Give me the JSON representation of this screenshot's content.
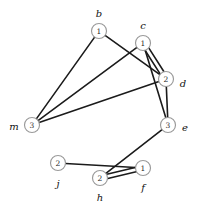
{
  "figure": {
    "type": "graph-diagram",
    "background_color": "#ffffff",
    "edge_color": "#1b1b1b",
    "node_fill": "#ffffff",
    "node_stroke": "#9a9a9a",
    "label_color": "#111111"
  },
  "nodes": [
    {
      "id": "b",
      "label": "b",
      "value": "1",
      "cx": 99,
      "cy": 31,
      "r": 7.5,
      "label_x": 99,
      "label_y": 13
    },
    {
      "id": "c",
      "label": "c",
      "value": "1",
      "cx": 143,
      "cy": 43,
      "r": 7.5,
      "label_x": 143,
      "label_y": 25
    },
    {
      "id": "d",
      "label": "d",
      "value": "2",
      "cx": 166,
      "cy": 79,
      "r": 7.5,
      "label_x": 183,
      "label_y": 83
    },
    {
      "id": "e",
      "label": "e",
      "value": "3",
      "cx": 168,
      "cy": 125,
      "r": 7.5,
      "label_x": 185,
      "label_y": 127
    },
    {
      "id": "m",
      "label": "m",
      "value": "3",
      "cx": 32,
      "cy": 125,
      "r": 7.5,
      "label_x": 14,
      "label_y": 126
    },
    {
      "id": "j",
      "label": "j",
      "value": "2",
      "cx": 58,
      "cy": 163,
      "r": 7.5,
      "label_x": 58,
      "label_y": 183
    },
    {
      "id": "h",
      "label": "h",
      "value": "2",
      "cx": 100,
      "cy": 178,
      "r": 7.5,
      "label_x": 100,
      "label_y": 197
    },
    {
      "id": "f",
      "label": "f",
      "value": "1",
      "cx": 143,
      "cy": 168,
      "r": 7.5,
      "label_x": 143,
      "label_y": 187
    }
  ],
  "edges": [
    {
      "from": "b",
      "to": "m",
      "offset": 0
    },
    {
      "from": "b",
      "to": "d",
      "offset": 0
    },
    {
      "from": "c",
      "to": "m",
      "offset": 0
    },
    {
      "from": "c",
      "to": "d",
      "offset": -2.2
    },
    {
      "from": "c",
      "to": "d",
      "offset": 2.2
    },
    {
      "from": "c",
      "to": "e",
      "offset": 0
    },
    {
      "from": "m",
      "to": "d",
      "offset": 0
    },
    {
      "from": "d",
      "to": "e",
      "offset": 0
    },
    {
      "from": "e",
      "to": "h",
      "offset": 0
    },
    {
      "from": "j",
      "to": "f",
      "offset": 0
    },
    {
      "from": "h",
      "to": "f",
      "offset": -2.2
    },
    {
      "from": "h",
      "to": "f",
      "offset": 2.2
    }
  ]
}
